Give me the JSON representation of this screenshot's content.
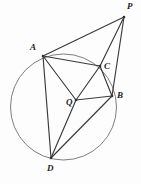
{
  "figure": {
    "background_color": "#fdfdfd",
    "width": 141,
    "height": 184,
    "line_color": "#3a3a3c",
    "circle_color": "#6f6f73",
    "label_color": "#1d1d1f"
  },
  "circle": {
    "name": "main-circle",
    "cx": 63.5,
    "cy": 107,
    "r": 53
  },
  "points": [
    {
      "id": "P",
      "label": "P",
      "x": 124,
      "y": 17,
      "label_x": 127,
      "label_y": 2,
      "on_circle": false
    },
    {
      "id": "A",
      "label": "A",
      "x": 43,
      "y": 56,
      "label_x": 30,
      "label_y": 43,
      "on_circle": true
    },
    {
      "id": "C",
      "label": "C",
      "x": 100,
      "y": 66,
      "label_x": 104,
      "label_y": 62,
      "on_circle": true
    },
    {
      "id": "B",
      "label": "B",
      "x": 112,
      "y": 96,
      "label_x": 117,
      "label_y": 91,
      "on_circle": true
    },
    {
      "id": "Q",
      "label": "Q",
      "x": 76,
      "y": 100,
      "label_x": 66,
      "label_y": 98,
      "on_circle": false
    },
    {
      "id": "D",
      "label": "D",
      "x": 51,
      "y": 158,
      "label_x": 47,
      "label_y": 164,
      "on_circle": true
    }
  ],
  "segments": [
    {
      "name": "segment-A-P",
      "from": "A",
      "to": "P"
    },
    {
      "name": "segment-P-C",
      "from": "P",
      "to": "C"
    },
    {
      "name": "segment-P-B",
      "from": "P",
      "to": "B"
    },
    {
      "name": "segment-A-C",
      "from": "A",
      "to": "C"
    },
    {
      "name": "segment-A-Q",
      "from": "A",
      "to": "Q"
    },
    {
      "name": "segment-A-D",
      "from": "A",
      "to": "D"
    },
    {
      "name": "segment-C-Q",
      "from": "C",
      "to": "Q"
    },
    {
      "name": "segment-C-B",
      "from": "C",
      "to": "B"
    },
    {
      "name": "segment-Q-B",
      "from": "Q",
      "to": "B"
    },
    {
      "name": "segment-Q-D",
      "from": "Q",
      "to": "D"
    },
    {
      "name": "segment-D-B",
      "from": "D",
      "to": "B"
    }
  ]
}
